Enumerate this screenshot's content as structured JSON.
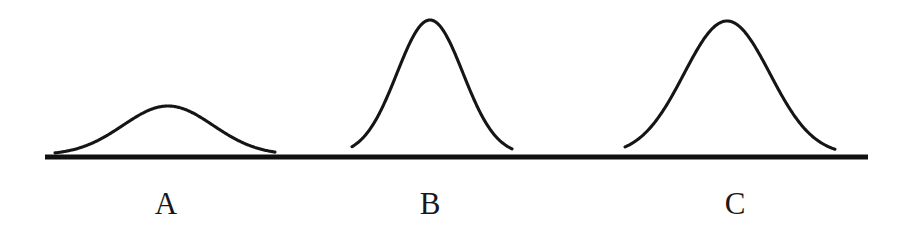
{
  "figure": {
    "type": "normal-distribution-comparison",
    "background_color": "#ffffff",
    "ink_color": "#151515",
    "width": 910,
    "height": 237
  },
  "axis": {
    "name": "baseline",
    "x_start": 45,
    "x_end": 868,
    "y": 157,
    "stroke_width": 5.2,
    "color": "#101010"
  },
  "labels": [
    {
      "text": "A",
      "center_x": 166,
      "top": 188
    },
    {
      "text": "B",
      "center_x": 430,
      "top": 188
    },
    {
      "text": "C",
      "center_x": 735,
      "top": 188
    }
  ],
  "chart_data": {
    "type": "line",
    "title": "",
    "subtitle": "",
    "xlabel": "",
    "ylabel": "",
    "grid": false,
    "legend_position": "below-axis",
    "axis_only_x": true,
    "xlim": [
      45,
      868
    ],
    "ylim": [
      0,
      140
    ],
    "annotations": [
      "A",
      "B",
      "C"
    ],
    "series": [
      {
        "name": "A",
        "shape": "gaussian",
        "peak_x": 168,
        "peak_y_px": 108,
        "height_px": 49,
        "base_left_x": 55,
        "base_right_x": 275,
        "base_width_px": 220,
        "relative_height": "low",
        "relative_spread": "wide",
        "sigma_px": 45
      },
      {
        "name": "B",
        "shape": "gaussian",
        "peak_x": 430,
        "peak_y_px": 22,
        "height_px": 135,
        "base_left_x": 352,
        "base_right_x": 512,
        "base_width_px": 160,
        "relative_height": "tall",
        "relative_spread": "narrow",
        "sigma_px": 33
      },
      {
        "name": "C",
        "shape": "gaussian",
        "peak_x": 727,
        "peak_y_px": 23,
        "height_px": 134,
        "base_left_x": 625,
        "base_right_x": 835,
        "base_width_px": 210,
        "relative_height": "tall",
        "relative_spread": "wide",
        "sigma_px": 43
      }
    ]
  }
}
